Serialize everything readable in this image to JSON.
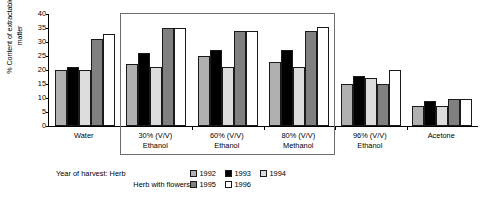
{
  "chart_data": {
    "type": "bar",
    "title": "",
    "xlabel": "",
    "ylabel": "% Content of extractable\nmatter",
    "ylim": [
      0,
      40
    ],
    "yticks": [
      0,
      5,
      10,
      15,
      20,
      25,
      30,
      35,
      40
    ],
    "grid": false,
    "legend_position": "bottom",
    "categories": [
      "Water",
      "30% (V/V)\nEthanol",
      "60% (V/V)\nEthanol",
      "80% (V/V)\nMethanol",
      "96% (V/V)\nEthanol",
      "Acetone"
    ],
    "series": [
      {
        "name": "1992",
        "color": "#b0b0b0",
        "values": [
          20,
          22,
          25,
          23,
          15,
          7
        ]
      },
      {
        "name": "1993",
        "color": "#000000",
        "values": [
          21,
          26,
          27,
          27,
          18,
          9
        ]
      },
      {
        "name": "1994",
        "color": "#dcdcdc",
        "values": [
          20,
          21,
          21,
          21,
          17,
          7
        ]
      },
      {
        "name": "1995",
        "color": "#808080",
        "values": [
          31,
          35,
          34,
          34,
          15,
          9.5
        ]
      },
      {
        "name": "1996",
        "color": "#ffffff",
        "values": [
          33,
          35,
          34,
          35.5,
          20,
          9.5
        ]
      }
    ],
    "annotations": [
      {
        "type": "highlight-box",
        "label": "organic-solvent-group-highlight",
        "covers_categories": [
          "30% (V/V) Ethanol",
          "60% (V/V) Ethanol",
          "80% (V/V) Methanol"
        ]
      }
    ]
  },
  "legend": {
    "rows": [
      {
        "title": "Year of harvest: Herb",
        "entries": [
          {
            "label": "1992",
            "color": "#b0b0b0"
          },
          {
            "label": "1993",
            "color": "#000000"
          },
          {
            "label": "1994",
            "color": "#dcdcdc"
          }
        ]
      },
      {
        "title": "Herb with flowers",
        "entries": [
          {
            "label": "1995",
            "color": "#808080"
          },
          {
            "label": "1996",
            "color": "#ffffff"
          }
        ]
      }
    ]
  }
}
